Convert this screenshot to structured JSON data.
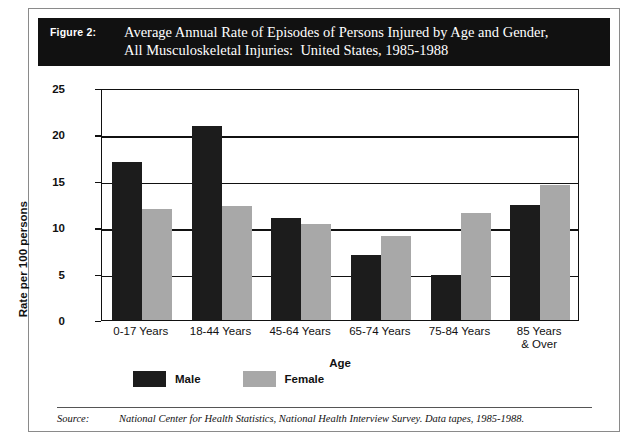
{
  "figure": {
    "number_label": "Figure 2:",
    "title_line1": "Average Annual Rate of Episodes of Persons Injured by Age and Gender,",
    "title_line2": "All Musculoskeletal Injuries:  United States, 1985-1988"
  },
  "source": {
    "label": "Source:",
    "text": "National Center for Health Statistics, National Health Interview Survey.  Data tapes, 1985-1988."
  },
  "legend": {
    "male": "Male",
    "female": "Female"
  },
  "colors": {
    "male_bar": "#1c1c1c",
    "female_bar": "#a8a8a8",
    "banner_background": "#111111",
    "banner_text": "#ffffff",
    "axis": "#111111",
    "page_background": "#ffffff"
  },
  "chart_data": {
    "type": "bar",
    "title": "Average Annual Rate of Episodes of Persons Injured by Age and Gender, All Musculoskeletal Injuries:  United States, 1985-1988",
    "xlabel": "Age",
    "ylabel": "Rate per 100 persons",
    "categories": [
      "0-17 Years",
      "18-44 Years",
      "45-64 Years",
      "65-74 Years",
      "75-84 Years",
      "85 Years\n& Over"
    ],
    "category_lines": [
      [
        "0-17 Years"
      ],
      [
        "18-44 Years"
      ],
      [
        "45-64 Years"
      ],
      [
        "65-74 Years"
      ],
      [
        "75-84 Years"
      ],
      [
        "85 Years",
        "& Over"
      ]
    ],
    "series": [
      {
        "name": "Male",
        "color": "#1c1c1c",
        "values": [
          17.0,
          20.9,
          11.0,
          7.0,
          4.8,
          12.4
        ]
      },
      {
        "name": "Female",
        "color": "#a8a8a8",
        "values": [
          12.0,
          12.3,
          10.4,
          9.0,
          11.5,
          14.5
        ]
      }
    ],
    "ylim": [
      0,
      25
    ],
    "yticks": [
      0,
      5,
      10,
      15,
      20,
      25
    ],
    "ytick_labels": [
      "0",
      "5",
      "10",
      "15",
      "20",
      "25"
    ],
    "grid": true,
    "grid_axis": "y",
    "legend_position": "below-plot-left"
  }
}
